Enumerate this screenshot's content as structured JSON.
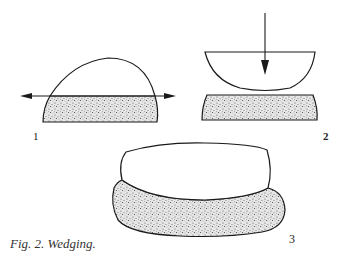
{
  "figure": {
    "caption": "Fig. 2. Wedging.",
    "panels": [
      {
        "label": "1",
        "description": "Dome of clay above stippled slab with horizontal double-headed arrow"
      },
      {
        "label": "2",
        "description": "Bowl-shaped clay half with downward arrow above stippled slab"
      },
      {
        "label": "3",
        "description": "Flattened clay piece resting on stippled clay"
      }
    ]
  },
  "colors": {
    "ink": "#1a1a1a",
    "stipple": "#9a9a9a",
    "background": "#ffffff"
  }
}
